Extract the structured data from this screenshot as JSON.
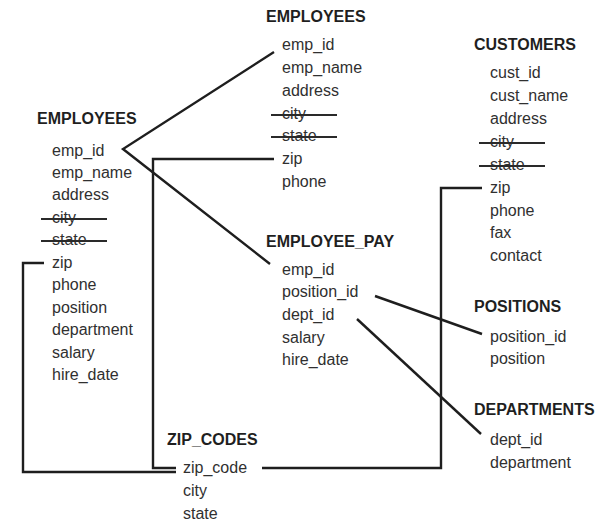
{
  "diagram": {
    "type": "database-normalization",
    "tables": {
      "employees_original": {
        "title": "EMPLOYEES",
        "fields": [
          {
            "name": "emp_id",
            "struck": false
          },
          {
            "name": "emp_name",
            "struck": false
          },
          {
            "name": "address",
            "struck": false
          },
          {
            "name": "city",
            "struck": true
          },
          {
            "name": "state",
            "struck": true
          },
          {
            "name": "zip",
            "struck": false
          },
          {
            "name": "phone",
            "struck": false
          },
          {
            "name": "position",
            "struck": false
          },
          {
            "name": "department",
            "struck": false
          },
          {
            "name": "salary",
            "struck": false
          },
          {
            "name": "hire_date",
            "struck": false
          }
        ]
      },
      "employees_new": {
        "title": "EMPLOYEES",
        "fields": [
          {
            "name": "emp_id",
            "struck": false
          },
          {
            "name": "emp_name",
            "struck": false
          },
          {
            "name": "address",
            "struck": false
          },
          {
            "name": "city",
            "struck": true
          },
          {
            "name": "state",
            "struck": true
          },
          {
            "name": "zip",
            "struck": false
          },
          {
            "name": "phone",
            "struck": false
          }
        ]
      },
      "customers": {
        "title": "CUSTOMERS",
        "fields": [
          {
            "name": "cust_id",
            "struck": false
          },
          {
            "name": "cust_name",
            "struck": false
          },
          {
            "name": "address",
            "struck": false
          },
          {
            "name": "city",
            "struck": true
          },
          {
            "name": "state",
            "struck": true
          },
          {
            "name": "zip",
            "struck": false
          },
          {
            "name": "phone",
            "struck": false
          },
          {
            "name": "fax",
            "struck": false
          },
          {
            "name": "contact",
            "struck": false
          }
        ]
      },
      "employee_pay": {
        "title": "EMPLOYEE_PAY",
        "fields": [
          {
            "name": "emp_id",
            "struck": false
          },
          {
            "name": "position_id",
            "struck": false
          },
          {
            "name": "dept_id",
            "struck": false
          },
          {
            "name": "salary",
            "struck": false
          },
          {
            "name": "hire_date",
            "struck": false
          }
        ]
      },
      "positions": {
        "title": "POSITIONS",
        "fields": [
          {
            "name": "position_id",
            "struck": false
          },
          {
            "name": "position",
            "struck": false
          }
        ]
      },
      "departments": {
        "title": "DEPARTMENTS",
        "fields": [
          {
            "name": "dept_id",
            "struck": false
          },
          {
            "name": "department",
            "struck": false
          }
        ]
      },
      "zip_codes": {
        "title": "ZIP_CODES",
        "fields": [
          {
            "name": "zip_code",
            "struck": false
          },
          {
            "name": "city",
            "struck": false
          },
          {
            "name": "state",
            "struck": false
          }
        ]
      }
    },
    "relationships": [
      {
        "from": "EMPLOYEES.emp_id",
        "to": "EMPLOYEES(new).emp_id"
      },
      {
        "from": "EMPLOYEES.emp_id",
        "to": "EMPLOYEE_PAY.emp_id"
      },
      {
        "from": "EMPLOYEES(new).zip",
        "to": "ZIP_CODES.zip_code"
      },
      {
        "from": "EMPLOYEES.zip",
        "to": "ZIP_CODES.zip_code"
      },
      {
        "from": "CUSTOMERS.zip",
        "to": "ZIP_CODES.zip_code"
      },
      {
        "from": "EMPLOYEE_PAY.position_id",
        "to": "POSITIONS.position_id"
      },
      {
        "from": "EMPLOYEE_PAY.dept_id",
        "to": "DEPARTMENTS.dept_id"
      }
    ],
    "colors": {
      "text": "#303030",
      "title": "#1f1f1f",
      "line": "#1e1e1e",
      "background": "#ffffff"
    }
  }
}
